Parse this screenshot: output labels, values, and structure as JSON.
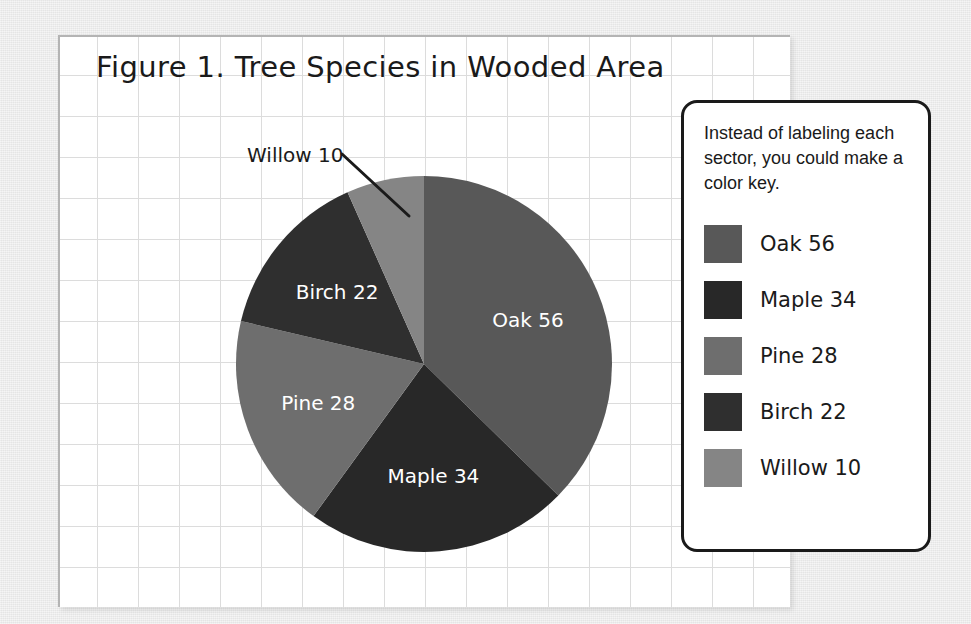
{
  "canvas": {
    "background_color": "#e9e9e9",
    "paper_color": "#ffffff",
    "grid_line_color": "#dcdcdc"
  },
  "chart_title": "Figure 1. Tree Species in Wooded Area",
  "callout": {
    "text": "Willow 10",
    "leader_line": true
  },
  "legend": {
    "note": "Instead of labeling each sector, you could make a color key.",
    "entries": [
      {
        "label": "Oak 56",
        "name": "Oak",
        "value": 56,
        "color": "#585858"
      },
      {
        "label": "Maple 34",
        "name": "Maple",
        "value": 34,
        "color": "#282828"
      },
      {
        "label": "Pine 28",
        "name": "Pine",
        "value": 28,
        "color": "#6e6e6e"
      },
      {
        "label": "Birch 22",
        "name": "Birch",
        "value": 22,
        "color": "#2f2f2f"
      },
      {
        "label": "Willow 10",
        "name": "Willow",
        "value": 10,
        "color": "#858585"
      }
    ]
  },
  "chart_data": {
    "type": "pie",
    "title": "Figure 1. Tree Species in Wooded Area",
    "xlabel": "",
    "ylabel": "",
    "total": 150,
    "start_angle_deg": 0,
    "direction": "clockwise",
    "legend_position": "right",
    "grid": true,
    "categories": [
      "Oak",
      "Maple",
      "Pine",
      "Birch",
      "Willow"
    ],
    "values": [
      56,
      34,
      28,
      22,
      10
    ],
    "labels": [
      "Oak 56",
      "Maple 34",
      "Pine 28",
      "Birch 22",
      "Willow 10"
    ],
    "colors": [
      "#585858",
      "#282828",
      "#6e6e6e",
      "#2f2f2f",
      "#858585"
    ],
    "slice_angles_deg": [
      134.4,
      81.6,
      67.2,
      52.8,
      24.0
    ],
    "percentages": [
      37.3,
      22.7,
      18.7,
      14.7,
      6.7
    ],
    "label_placement": [
      "inside",
      "inside",
      "inside",
      "inside",
      "outside-callout"
    ],
    "annotations": [
      {
        "text": "Willow 10",
        "target": "Willow",
        "style": "leader-line"
      },
      {
        "text": "Instead of labeling each sector, you could make a color key.",
        "target": "legend",
        "style": "note"
      }
    ]
  }
}
